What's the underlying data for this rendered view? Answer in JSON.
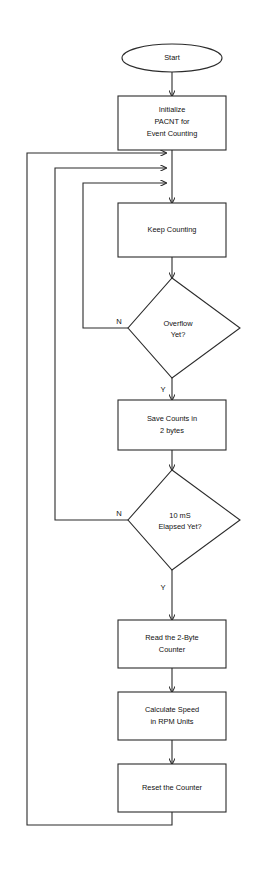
{
  "diagram": {
    "line_color": "#2b2b2b",
    "fill_color": "#ffffff",
    "text_color": "#111111",
    "nodes": [
      {
        "id": "start",
        "type": "terminator",
        "label": "Start",
        "lines": [
          "Start"
        ]
      },
      {
        "id": "initialize",
        "type": "process",
        "label": "Initialize PACNT for Event Counting",
        "lines": [
          "Initialize",
          "PACNT for",
          "Event Counting"
        ]
      },
      {
        "id": "keep-counting",
        "type": "process",
        "label": "Keep Counting",
        "lines": [
          "Keep Counting"
        ]
      },
      {
        "id": "overflow-yet",
        "type": "decision",
        "label": "Overflow Yet?",
        "lines": [
          "Overflow",
          "Yet?"
        ]
      },
      {
        "id": "save-counts",
        "type": "process",
        "label": "Save Counts in 2 bytes",
        "lines": [
          "Save Counts in",
          "2 bytes"
        ]
      },
      {
        "id": "elapsed-yet",
        "type": "decision",
        "label": "10 mS Elapsed Yet?",
        "lines": [
          "10 mS",
          "Elapsed Yet?"
        ]
      },
      {
        "id": "read-counter",
        "type": "process",
        "label": "Read the 2-Byte Counter",
        "lines": [
          "Read the 2-Byte",
          "Counter"
        ]
      },
      {
        "id": "calculate-speed",
        "type": "process",
        "label": "Calculate Speed in RPM Units",
        "lines": [
          "Calculate Speed",
          "in RPM Units"
        ]
      },
      {
        "id": "reset-counter",
        "type": "process",
        "label": "Reset the Counter",
        "lines": [
          "Reset the Counter"
        ]
      }
    ],
    "branch_labels": {
      "overflow_no": "N",
      "overflow_yes": "Y",
      "elapsed_no": "N",
      "elapsed_yes": "Y"
    }
  }
}
